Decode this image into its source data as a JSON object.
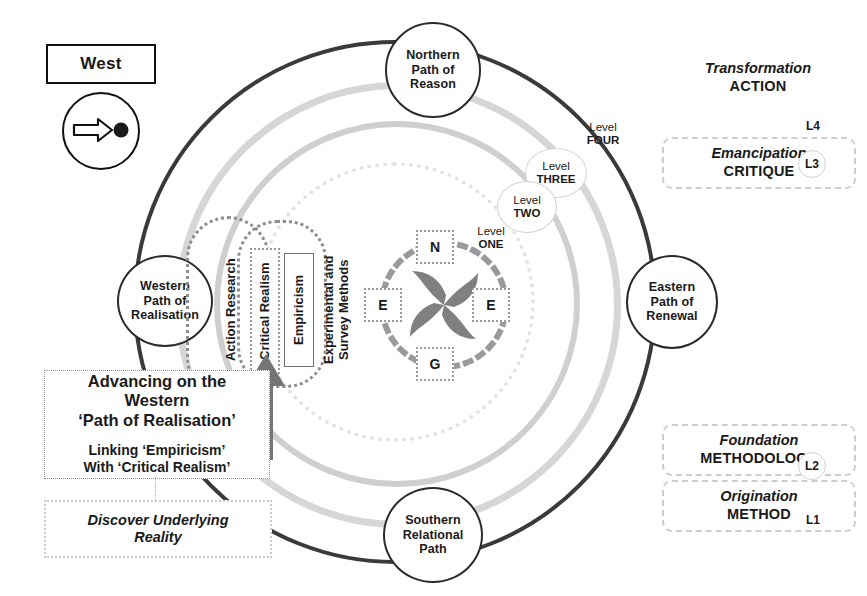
{
  "legend": {
    "direction_label": "West",
    "compass_icon": "arrow-right-dot-icon"
  },
  "paths": {
    "north": "Northern\nPath of\nReason",
    "north_lines": [
      "Northern",
      "Path of",
      "Reason"
    ],
    "south_lines": [
      "Southern",
      "Relational",
      "Path"
    ],
    "west_lines": [
      "Western",
      "Path of",
      "Realisation"
    ],
    "east_lines": [
      "Eastern",
      "Path of",
      "Renewal"
    ]
  },
  "levels": [
    {
      "word": "Level",
      "num": "FOUR"
    },
    {
      "word": "Level",
      "num": "THREE"
    },
    {
      "word": "Level",
      "num": "TWO"
    },
    {
      "word": "Level",
      "num": "ONE"
    }
  ],
  "right_levels": [
    {
      "italic": "Transformation",
      "caps": "ACTION",
      "tag": "L4"
    },
    {
      "italic": "Emancipation",
      "caps": "CRITIQUE",
      "tag": "L3"
    },
    {
      "italic": "Foundation",
      "caps": "METHODOLOGY",
      "tag": "L2"
    },
    {
      "italic": "Origination",
      "caps": "METHOD",
      "tag": "L1"
    }
  ],
  "methods": [
    {
      "text": "Action Research"
    },
    {
      "text": "Critical Realism"
    },
    {
      "text": "Empiricism"
    },
    {
      "text": "Experimental and Survey Methods"
    }
  ],
  "center": {
    "keys": {
      "north": "N",
      "east_left": "E",
      "east_right": "E",
      "south": "G"
    },
    "icon": "pinwheel-icon"
  },
  "callout": {
    "line1": "Advancing on the",
    "line2": "Western",
    "line3": "‘Path of Realisation’",
    "line4": "Linking ‘Empiricism’",
    "line5": "With ‘Critical Realism’"
  },
  "discover": {
    "line1": "Discover Underlying",
    "line2": "Reality"
  },
  "colors": {
    "main_ring": "#3a3a3a",
    "gray_ring": "#d6d6d6",
    "pinwheel": "#808080",
    "arrow": "#757575",
    "dotted": "#9a9a9a"
  }
}
